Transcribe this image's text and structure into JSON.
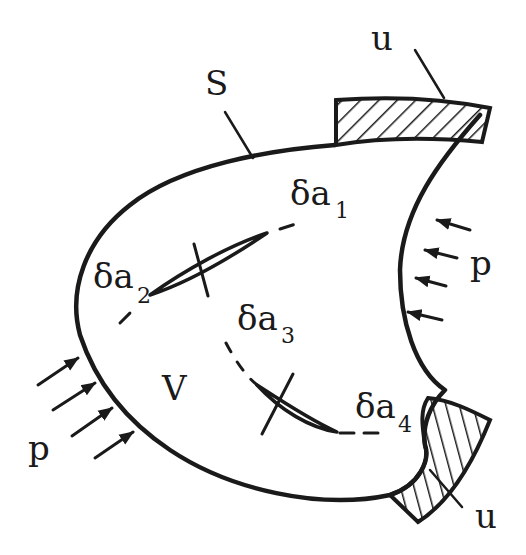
{
  "diagram": {
    "type": "solid-body-with-cracks",
    "colors": {
      "ink": "#1a1a1a",
      "background": "#ffffff"
    },
    "labels": {
      "surface": "S",
      "volume": "V",
      "displacement_top": "u",
      "displacement_bottom": "u",
      "traction_left": "p",
      "traction_right": "p"
    },
    "cracks": [
      {
        "prefix": "δa",
        "index": "1"
      },
      {
        "prefix": "δa",
        "index": "2"
      },
      {
        "prefix": "δa",
        "index": "3"
      },
      {
        "prefix": "δa",
        "index": "4"
      }
    ]
  }
}
